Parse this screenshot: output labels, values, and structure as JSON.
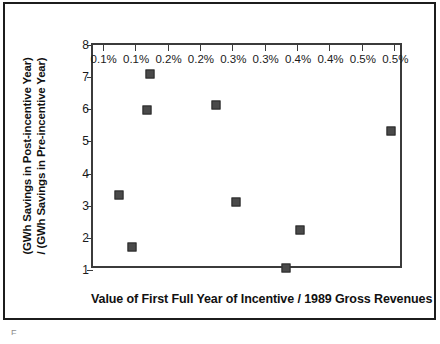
{
  "chart_data": {
    "type": "scatter",
    "title": "",
    "xlabel": "Value of First Full Year of Incentive / 1989 Gross Revenues",
    "ylabel_line1": "(GWh Savings in Post-incentive Year)",
    "ylabel_line2": "/ (GWh Savings in Pre-incentive Year)",
    "x_tick_labels": [
      "0.1%",
      "0.1%",
      "0.2%",
      "0.2%",
      "0.3%",
      "0.3%",
      "0.4%",
      "0.4%",
      "0.5%",
      "0.5%"
    ],
    "x_tick_values": [
      0.1,
      0.15,
      0.2,
      0.25,
      0.3,
      0.35,
      0.4,
      0.45,
      0.5,
      0.55
    ],
    "y_tick_labels": [
      "1",
      "2",
      "3",
      "4",
      "5",
      "6",
      "7",
      "8"
    ],
    "y_tick_values": [
      1,
      2,
      3,
      4,
      5,
      6,
      7,
      8
    ],
    "xlim": [
      0.085,
      0.565
    ],
    "ylim": [
      1,
      8
    ],
    "grid": false,
    "legend": false,
    "marker_color": "#4a4a4a",
    "marker_edge_color": "#2a2a2a",
    "axis_color": "#3b3b3b",
    "points": [
      {
        "x": 0.125,
        "y": 3.33
      },
      {
        "x": 0.145,
        "y": 1.73
      },
      {
        "x": 0.168,
        "y": 5.98
      },
      {
        "x": 0.173,
        "y": 7.11
      },
      {
        "x": 0.275,
        "y": 6.12
      },
      {
        "x": 0.305,
        "y": 3.11
      },
      {
        "x": 0.383,
        "y": 1.05
      },
      {
        "x": 0.405,
        "y": 2.24
      },
      {
        "x": 0.545,
        "y": 5.33
      }
    ]
  },
  "figure": {
    "caption_fragment": "F"
  }
}
